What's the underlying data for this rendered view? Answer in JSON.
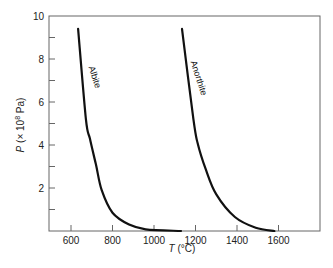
{
  "chart_data": {
    "type": "line",
    "title": "",
    "xlabel": "T (°C)",
    "ylabel": "P (× 10^8 Pa)",
    "xlim": [
      500,
      1800
    ],
    "ylim": [
      0,
      10
    ],
    "x_ticks": [
      600,
      800,
      1000,
      1200,
      1400,
      1600
    ],
    "y_ticks_labeled": [
      2,
      4,
      6,
      8,
      10
    ],
    "y_ticks_minor": [
      1,
      3,
      5,
      7,
      9
    ],
    "grid": false,
    "legend": "none (inline curve labels)",
    "series": [
      {
        "name": "Albite",
        "x": [
          634,
          672,
          691,
          720,
          748,
          800,
          880,
          960,
          1130
        ],
        "y": [
          9.4,
          5.2,
          4.3,
          3.1,
          1.9,
          0.85,
          0.3,
          0.08,
          0
        ]
      },
      {
        "name": "Anorthite",
        "x": [
          1135,
          1190,
          1210,
          1250,
          1300,
          1390,
          1490,
          1580
        ],
        "y": [
          9.4,
          5.2,
          4.1,
          2.85,
          1.7,
          0.65,
          0.15,
          0
        ]
      }
    ]
  },
  "labels": {
    "xlabel_italic": "T",
    "xlabel_rest": " (°C)",
    "ylabel_italic": "P",
    "ylabel_rest": " (× 10",
    "ylabel_exp": "8",
    "ylabel_unit": " Pa)",
    "curve1": "Albite",
    "curve2": "Anorthite"
  },
  "colors": {
    "curve": "#111111",
    "axis": "#666666",
    "text": "#222222"
  }
}
